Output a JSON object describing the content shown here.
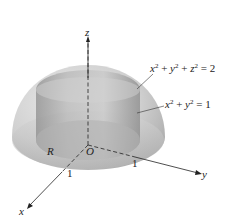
{
  "figure": {
    "type": "3d-surface-diagram",
    "surfaces": [
      {
        "id": "sphere",
        "equation_display": "x² + y² + z² = 2",
        "lhs_terms": [
          "x",
          "y",
          "z"
        ],
        "rhs": "2"
      },
      {
        "id": "cylinder",
        "equation_display": "x² + y² = 1",
        "lhs_terms": [
          "x",
          "y"
        ],
        "rhs": "1"
      }
    ],
    "axes": {
      "x": {
        "label": "x",
        "tick": "1"
      },
      "y": {
        "label": "y",
        "tick": "1"
      },
      "z": {
        "label": "z"
      }
    },
    "origin_label": "O",
    "region_label": "R",
    "colors": {
      "sphere_fill": "#c9c9c9",
      "cylinder_fill": "#a9a9a9",
      "axis": "#222222",
      "background": "#ffffff"
    }
  }
}
